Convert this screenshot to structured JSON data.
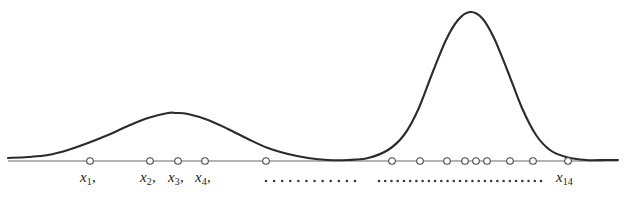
{
  "figure": {
    "type": "density-curve-with-rug",
    "background_color": "#ffffff",
    "curve_color": "#2b2b2b",
    "axis_color": "#9a9a9a",
    "marker_color": "#4a4a4a",
    "dot_color": "#3a3a3a",
    "label_color": "#1c1c1c",
    "width": 626,
    "height": 198
  },
  "axis": {
    "baseline_y": 161,
    "x_start": 8,
    "x_end": 618
  },
  "chart_data": {
    "type": "line",
    "title": "",
    "subtitle": "",
    "xlabel": "",
    "ylabel": "",
    "grid": false,
    "legend": "none",
    "xlim": [
      0,
      626
    ],
    "ylim": [
      0,
      1
    ],
    "series": [
      {
        "name": "density",
        "modes": [
          {
            "label": "mode-1",
            "center_x": 176,
            "peak_y": 113,
            "peak_height": 0.33,
            "spread": 62
          },
          {
            "label": "mode-2",
            "center_x": 470,
            "peak_y": 12,
            "peak_height": 1.0,
            "spread": 33
          }
        ],
        "points": [
          [
            8,
            158
          ],
          [
            28,
            157
          ],
          [
            48,
            155
          ],
          [
            68,
            150
          ],
          [
            88,
            143
          ],
          [
            108,
            135
          ],
          [
            128,
            126
          ],
          [
            148,
            118
          ],
          [
            168,
            113
          ],
          [
            176,
            113
          ],
          [
            188,
            114
          ],
          [
            208,
            120
          ],
          [
            228,
            129
          ],
          [
            248,
            139
          ],
          [
            268,
            148
          ],
          [
            288,
            154
          ],
          [
            308,
            158
          ],
          [
            328,
            160
          ],
          [
            348,
            160
          ],
          [
            368,
            158
          ],
          [
            388,
            150
          ],
          [
            404,
            135
          ],
          [
            418,
            110
          ],
          [
            432,
            74
          ],
          [
            446,
            40
          ],
          [
            458,
            20
          ],
          [
            470,
            12
          ],
          [
            482,
            18
          ],
          [
            494,
            38
          ],
          [
            508,
            72
          ],
          [
            522,
            108
          ],
          [
            536,
            135
          ],
          [
            550,
            150
          ],
          [
            566,
            157
          ],
          [
            586,
            160
          ],
          [
            606,
            160
          ],
          [
            618,
            160
          ]
        ]
      }
    ],
    "markers": {
      "name": "observations",
      "radius": 3.3,
      "y": 161,
      "left_cluster_x": [
        90,
        150,
        178,
        205,
        266
      ],
      "right_cluster_x": [
        392,
        420,
        447,
        465,
        476,
        487,
        510,
        533,
        568
      ]
    }
  },
  "labels": {
    "x1": {
      "base": "x",
      "sub": "1",
      "comma": ",",
      "x": 80,
      "y": 174
    },
    "x2": {
      "base": "x",
      "sub": "2",
      "comma": ",",
      "x": 140,
      "y": 174
    },
    "x3": {
      "base": "x",
      "sub": "3",
      "comma": ",",
      "x": 168,
      "y": 174
    },
    "x4": {
      "base": "x",
      "sub": "4",
      "comma": ",",
      "x": 195,
      "y": 174
    },
    "x14": {
      "base": "x",
      "sub": "14",
      "comma": "",
      "x": 556,
      "y": 174
    }
  },
  "ellipses": {
    "left": {
      "name": "left-ellipsis-dots",
      "count": 12,
      "x_start": 266,
      "x_end": 355,
      "y": 181,
      "radius": 1.3
    },
    "right": {
      "name": "right-ellipsis-dots",
      "count": 27,
      "x_start": 379,
      "x_end": 541,
      "y": 181,
      "radius": 1.3
    }
  }
}
